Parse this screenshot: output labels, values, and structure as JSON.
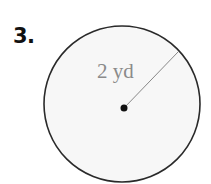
{
  "problem": {
    "number": "3."
  },
  "figure": {
    "shape": "circle",
    "radius_label": "2 yd",
    "colors": {
      "stroke": "#2a2a2a",
      "fill": "#f7f7f7",
      "radius_line": "#888888",
      "label": "#8a8a8a",
      "center_dot": "#111111"
    }
  }
}
